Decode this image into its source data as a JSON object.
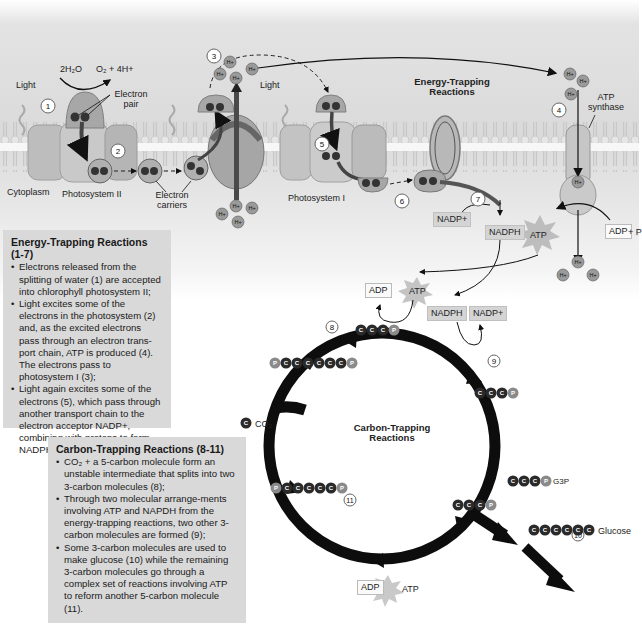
{
  "diagram": {
    "title_energy": "Energy-Trapping Reactions",
    "title_carbon": "Carbon-Trapping Reactions",
    "membrane_label": "Membrane",
    "labels": {
      "light1": "Light",
      "light2": "Light",
      "water": "2H₂O",
      "oxygen": "O₂ + 4H+",
      "electron_pair": "Electron pair",
      "cytoplasm": "Cytoplasm",
      "photosystem2": "Photosystem II",
      "electron_carriers": "Electron carriers",
      "photosystem1": "Photosystem I",
      "atp_synthase": "ATP synthase",
      "nadp_plus_1": "NADP+",
      "nadph_1": "NADPH",
      "atp_1": "ATP",
      "adp_p": "ADP",
      "plus_p": "+ P",
      "adp_2": "ADP",
      "atp_2": "ATP",
      "nadph_2": "NADPH",
      "nadp_plus_2": "NADP+",
      "co2": "CO₂",
      "g3p": "G3P",
      "glucose": "Glucose",
      "adp_3": "ADP",
      "atp_3": "ATP",
      "h_plus": "H+"
    },
    "steps": [
      "1",
      "2",
      "3",
      "4",
      "5",
      "6",
      "7",
      "8",
      "9",
      "10",
      "11"
    ],
    "molecules": {
      "cccp_top": [
        "C",
        "C",
        "C",
        "P"
      ],
      "pcccccccp_top": [
        "P",
        "C",
        "C",
        "C",
        "C",
        "C",
        "C",
        "P"
      ],
      "cccp_right": [
        "C",
        "C",
        "C",
        "P"
      ],
      "co2_c": [
        "C"
      ],
      "cccp_g3p": [
        "C",
        "C",
        "C",
        "P"
      ],
      "glucose": [
        "C",
        "C",
        "C",
        "C",
        "C",
        "C"
      ],
      "pcccccp_bottom": [
        "P",
        "C",
        "C",
        "C",
        "C",
        "C",
        "P"
      ],
      "cccp_bottom": [
        "C",
        "C",
        "C",
        "P"
      ]
    },
    "colors": {
      "membrane_bg": "#cfcfcf",
      "protein": "#b8b8b8",
      "carbon": "#2a2a2a",
      "phosphate": "#8a8a8a",
      "cycle": "#0d0d0d"
    }
  },
  "energy_box": {
    "heading": "Energy-Trapping Reactions (1-7)",
    "bullets": [
      "Electrons released from the splitting of water (1) are accepted into chlorophyll photosystem II;",
      "Light excites some of the electrons in the photosystem (2) and, as the excited electrons pass through an electron trans-port chain, ATP is produced (4). The electrons pass to photosystem I (3);",
      "Light again excites some of the electrons (5), which pass through another transport chain to the electron acceptor NADP+, combining with protons to form NADPH (7)."
    ]
  },
  "carbon_box": {
    "heading": "Carbon-Trapping Reactions (8-11)",
    "bullets": [
      "CO₂ + a 5-carbon molecule form an unstable intermediate that splits into two 3-carbon molecules (8);",
      "Through two molecular arrange-ments involving ATP and NAPDH from the energy-trapping reactions, two other 3-carbon molecules are formed (9);",
      "Some 3-carbon molecules are used to make glucose (10) while the remaining 3-carbon molecules go through a complex set of reactions involving ATP to reform another 5-carbon molecule (11)."
    ]
  }
}
